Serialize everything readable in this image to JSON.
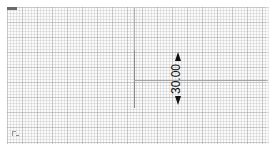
{
  "canvas": {
    "grid": "on",
    "background": "#fbfbfb",
    "grid_color": "#c8c8c8"
  },
  "dimension": {
    "value": "30.00",
    "orientation": "vertical",
    "arrow_color": "#111111"
  },
  "icons": {
    "origin_marker": "ucs-origin-icon",
    "corner_badge": "view-badge-icon"
  }
}
